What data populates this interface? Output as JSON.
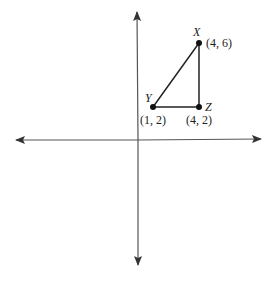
{
  "diagram": {
    "type": "coordinate-plane-triangle",
    "colors": {
      "background": "#ffffff",
      "axis": "#555555",
      "triangle": "#222222",
      "point": "#111111",
      "text": "#222222"
    },
    "axes": {
      "x_axis": {
        "arrows": "both"
      },
      "y_axis": {
        "arrows": "both"
      }
    },
    "points": [
      {
        "name": "X",
        "coord_label": "(4, 6)",
        "x": 4,
        "y": 6
      },
      {
        "name": "Y",
        "coord_label": "(1, 2)",
        "x": 1,
        "y": 2
      },
      {
        "name": "Z",
        "coord_label": "(4, 2)",
        "x": 4,
        "y": 2
      }
    ],
    "segments": [
      {
        "from": "X",
        "to": "Y"
      },
      {
        "from": "Y",
        "to": "Z"
      },
      {
        "from": "Z",
        "to": "X"
      }
    ]
  }
}
